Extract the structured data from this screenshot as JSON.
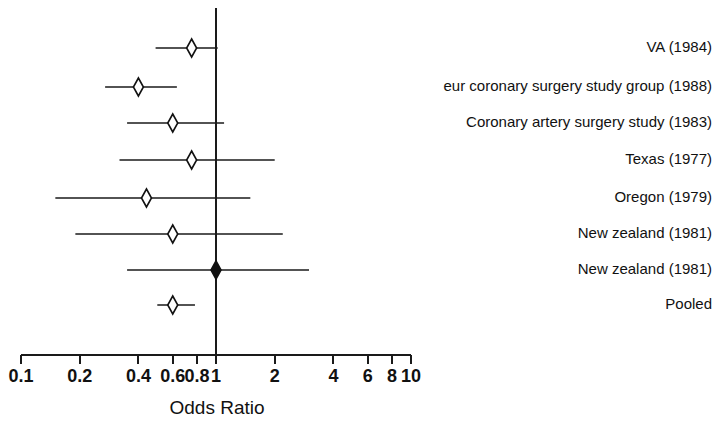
{
  "chart_data": {
    "type": "forest",
    "title": "",
    "xlabel": "Odds Ratio",
    "ylabel": "",
    "xscale": "log",
    "xlim": [
      0.1,
      10
    ],
    "grid": false,
    "legend": "none",
    "null_value": 1,
    "tick_labels": [
      "0.1",
      "0.2",
      "0.4",
      "0.6",
      "0.8",
      "1",
      "2",
      "4",
      "6",
      "8",
      "10"
    ],
    "tick_values": [
      0.1,
      0.2,
      0.4,
      0.6,
      0.8,
      1,
      2,
      4,
      6,
      8,
      10
    ],
    "studies": [
      {
        "label": "VA (1984)",
        "odds_ratio": 0.75,
        "ci_low": 0.49,
        "ci_high": 1.02,
        "marker": "diamond-open"
      },
      {
        "label": "eur coronary surgery study group (1988)",
        "odds_ratio": 0.4,
        "ci_low": 0.27,
        "ci_high": 0.63,
        "marker": "diamond-open"
      },
      {
        "label": "Coronary artery surgery study (1983)",
        "odds_ratio": 0.6,
        "ci_low": 0.35,
        "ci_high": 1.1,
        "marker": "diamond-open"
      },
      {
        "label": "Texas (1977)",
        "odds_ratio": 0.75,
        "ci_low": 0.32,
        "ci_high": 2.0,
        "marker": "diamond-open"
      },
      {
        "label": "Oregon (1979)",
        "odds_ratio": 0.44,
        "ci_low": 0.15,
        "ci_high": 1.5,
        "marker": "diamond-open"
      },
      {
        "label": "New zealand (1981)",
        "odds_ratio": 0.6,
        "ci_low": 0.19,
        "ci_high": 2.2,
        "marker": "diamond-open"
      },
      {
        "label": "New zealand (1981)",
        "odds_ratio": 1.0,
        "ci_low": 0.35,
        "ci_high": 3.0,
        "marker": "diamond-filled"
      },
      {
        "label": "Pooled",
        "odds_ratio": 0.6,
        "ci_low": 0.5,
        "ci_high": 0.78,
        "marker": "diamond-open"
      }
    ]
  },
  "colors": {
    "ink": "#111111",
    "background": "#ffffff"
  }
}
